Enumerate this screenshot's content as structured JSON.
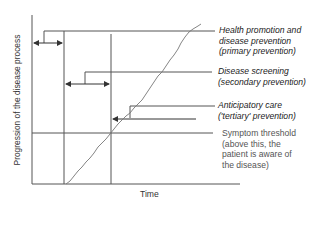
{
  "diagram": {
    "title": "",
    "y_axis_label": "Progression of the disease process",
    "x_axis_label": "Time",
    "labels": {
      "primary": {
        "line1": "Health promotion and",
        "line2": "disease prevention",
        "line3": "(primary prevention)"
      },
      "secondary": {
        "line1": "Disease screening",
        "line2": "(secondary prevention)"
      },
      "tertiary": {
        "line1": "Anticipatory care",
        "line2": "('tertiary' prevention)"
      },
      "threshold": {
        "line1": "Symptom threshold",
        "line2": "(above this, the",
        "line3": "patient is aware of",
        "line4": "the disease)"
      }
    },
    "colors": {
      "lines": "#555555",
      "text": "#222222",
      "curve": "#777777"
    }
  }
}
